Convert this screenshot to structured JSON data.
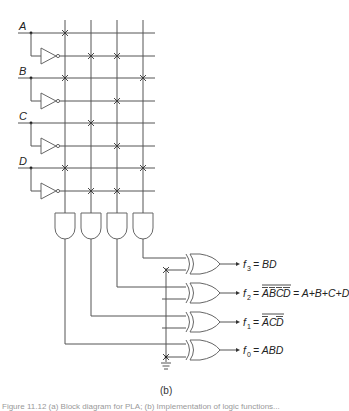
{
  "diagram": {
    "type": "PLA (programmable logic array) circuit",
    "inputs": [
      "A",
      "B",
      "C",
      "D"
    ],
    "input_lines": [
      "A",
      "A'",
      "B",
      "B'",
      "C",
      "C'",
      "D",
      "D'"
    ],
    "product_terms": [
      {
        "index": 0,
        "fuses": [
          "A",
          "B",
          "D"
        ],
        "term": "ABD"
      },
      {
        "index": 1,
        "fuses": [
          "A'",
          "C",
          "D'"
        ],
        "term": "A'CD'"
      },
      {
        "index": 2,
        "fuses": [
          "A'",
          "B'",
          "C'",
          "D'"
        ],
        "term": "A'B'C'D'"
      },
      {
        "index": 3,
        "fuses": [
          "B",
          "D"
        ],
        "term": "BD"
      }
    ],
    "xor_control_fuses": [
      "f3",
      "f0"
    ],
    "outputs": [
      {
        "name": "f3",
        "label": "f",
        "sub": "3",
        "expr": "= BD"
      },
      {
        "name": "f2",
        "label": "f",
        "sub": "2",
        "expr_overbar": "ABCD",
        "expr_rest": "= A+B+C+D"
      },
      {
        "name": "f1",
        "label": "f",
        "sub": "1",
        "expr_overbar": "ACD"
      },
      {
        "name": "f0",
        "label": "f",
        "sub": "0",
        "expr": "= ABD"
      }
    ]
  },
  "labels": {
    "A": "A",
    "B": "B",
    "C": "C",
    "D": "D",
    "f3": "f",
    "f3_sub": "3",
    "f3_expr": "= BD",
    "f2": "f",
    "f2_sub": "2",
    "f2_eq": "=",
    "f2_overbar_part1": "A",
    "f2_overbar_part2": "B",
    "f2_overbar_part3": "C",
    "f2_overbar_part4": "D",
    "f2_rest": "= A+B+C+D",
    "f1": "f",
    "f1_sub": "1",
    "f1_eq": "=",
    "f1_overbar_part1": "A",
    "f1_overbar_part2": "C",
    "f1_overbar_part3": "D",
    "f0": "f",
    "f0_sub": "0",
    "f0_expr": "= ABD",
    "panel": "(b)"
  },
  "caption": "Figure 11.12 (a) Block diagram for PLA; (b) Implementation of logic functions..."
}
